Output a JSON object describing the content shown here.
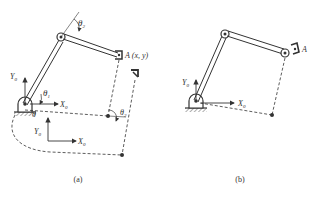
{
  "figure": {
    "panel_a": {
      "caption": "(a)",
      "labels": {
        "theta1": "θ",
        "theta1_sub": "1",
        "theta2": "θ",
        "theta2_sub": "2",
        "theta2_prime": "θ",
        "theta2_prime_sub": "2",
        "theta1_prime": "θ",
        "point_a": "A (x, y)",
        "y0_top": "Y",
        "y0_top_sub": "0",
        "x0_top": "X",
        "x0_top_sub": "0",
        "y0_bottom": "Y",
        "y0_bottom_sub": "0",
        "x0_bottom": "X",
        "x0_bottom_sub": "0"
      }
    },
    "panel_b": {
      "caption": "(b)",
      "labels": {
        "point_a": "A",
        "y0": "Y",
        "y0_sub": "0",
        "x0": "X",
        "x0_sub": "0"
      }
    },
    "colors": {
      "line": "#333333",
      "background": "#ffffff"
    }
  }
}
